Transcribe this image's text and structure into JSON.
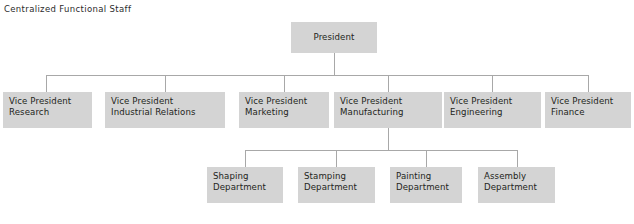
{
  "caption": "Centralized Functional Staff",
  "colors": {
    "node_fill": "#d4d4d4",
    "connector": "#a8a8a8",
    "text": "#231f20",
    "background": "#ffffff"
  },
  "chart": {
    "type": "organization-chart",
    "root": {
      "label": "President"
    },
    "level1": [
      {
        "label": "Vice President\nResearch"
      },
      {
        "label": "Vice President\nIndustrial Relations"
      },
      {
        "label": "Vice President\nMarketing"
      },
      {
        "label": "Vice President\nManufacturing"
      },
      {
        "label": "Vice President\nEngineering"
      },
      {
        "label": "Vice President\nFinance"
      }
    ],
    "level2_parent": "Vice President\nManufacturing",
    "level2": [
      {
        "label": "Shaping\nDepartment"
      },
      {
        "label": "Stamping\nDepartment"
      },
      {
        "label": "Painting\nDepartment"
      },
      {
        "label": "Assembly\nDepartment"
      }
    ]
  }
}
